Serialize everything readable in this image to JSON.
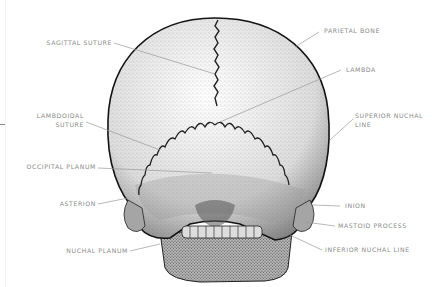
{
  "figure": {
    "colors": {
      "label_text": "#8a8a8a",
      "leader_line": "#9a9a9a",
      "bone_outline": "#1a1a1a",
      "stipple": "#3a3a3a"
    }
  },
  "labels": {
    "left": [
      {
        "id": "sagittal-suture",
        "text": "SAGITTAL SUTURE"
      },
      {
        "id": "lambdoidal-suture",
        "text": "LAMBDOIDAL",
        "text2": "SUTURE"
      },
      {
        "id": "occipital-planum",
        "text": "OCCIPITAL PLANUM"
      },
      {
        "id": "asterion",
        "text": "ASTERION"
      },
      {
        "id": "nuchal-planum",
        "text": "NUCHAL PLANUM"
      }
    ],
    "right": [
      {
        "id": "parietal-bone",
        "text": "PARIETAL BONE"
      },
      {
        "id": "lambda",
        "text": "LAMBDA"
      },
      {
        "id": "superior-nuchal-line",
        "text": "SUPERIOR NUCHAL",
        "text2": "LINE"
      },
      {
        "id": "inion",
        "text": "INION"
      },
      {
        "id": "mastoid-process",
        "text": "MASTOID PROCESS"
      },
      {
        "id": "inferior-nuchal-line",
        "text": "INFERIOR NUCHAL LINE"
      }
    ]
  }
}
